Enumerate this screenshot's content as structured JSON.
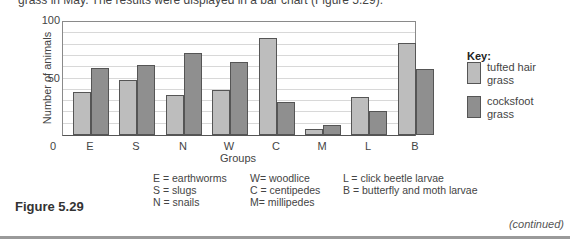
{
  "intro_text": "grass in May. The results were displayed in a bar chart (Figure 5.29).",
  "chart_data": {
    "type": "bar",
    "title": "",
    "xlabel": "Groups",
    "ylabel": "Number of animals",
    "ylim": [
      0,
      100
    ],
    "yticks": [
      "0",
      "50",
      "100"
    ],
    "grid": true,
    "grid_step": 10,
    "legend_title": "Key:",
    "legend_position": "right",
    "categories": [
      "E",
      "S",
      "N",
      "W",
      "C",
      "M",
      "L",
      "B"
    ],
    "series": [
      {
        "name": "tufted hair grass",
        "color": "#bdbdbd",
        "values": [
          38,
          49,
          35,
          40,
          86,
          5,
          34,
          81
        ]
      },
      {
        "name": "cocksfoot grass",
        "color": "#8f8f8f",
        "values": [
          59,
          62,
          73,
          65,
          29,
          9,
          21,
          58
        ]
      }
    ]
  },
  "legend": {
    "title": "Key:",
    "items": [
      {
        "label": "tufted hair grass"
      },
      {
        "label": "cocksfoot grass"
      }
    ]
  },
  "group_key": {
    "col1": [
      "E = earthworms",
      "S = slugs",
      "N = snails"
    ],
    "col2": [
      "W= woodlice",
      "C = centipedes",
      "M= millipedes"
    ],
    "col3": [
      "L = click beetle larvae",
      "B = butterfly and moth larvae"
    ]
  },
  "figure_label": "Figure 5.29",
  "continued_label": "(continued)"
}
